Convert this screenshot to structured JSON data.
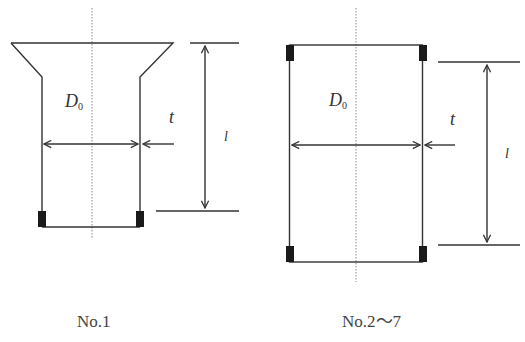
{
  "diagrams": [
    {
      "id": "no1",
      "caption": "No.1",
      "labels": {
        "diameter": "D",
        "diameter_sub": "0",
        "thickness": "t",
        "length": "l"
      }
    },
    {
      "id": "no2-7",
      "caption": "No.2～7",
      "labels": {
        "diameter": "D",
        "diameter_sub": "0",
        "thickness": "t",
        "length": "l"
      }
    }
  ],
  "colors": {
    "stroke": "#333333",
    "block": "#1a1a1a",
    "centerline": "#888888"
  }
}
